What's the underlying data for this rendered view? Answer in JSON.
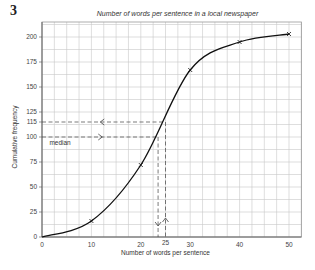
{
  "question_number": "3",
  "chart_data": {
    "type": "line",
    "title": "Number of words per sentence in a local newspaper",
    "xlabel": "Number of words per sentence",
    "ylabel": "Cumulative frequency",
    "xlim": [
      0,
      52.5
    ],
    "ylim": [
      0,
      215
    ],
    "x_ticks": [
      0,
      10,
      20,
      25,
      30,
      40,
      50
    ],
    "y_ticks": [
      0,
      25,
      50,
      75,
      100,
      115,
      125,
      150,
      175,
      200
    ],
    "grid": true,
    "series": [
      {
        "name": "Cumulative frequency curve",
        "x": [
          0,
          10,
          20,
          30,
          40,
          50
        ],
        "y": [
          0,
          16,
          72,
          167,
          195,
          203
        ],
        "markers": "cross"
      }
    ],
    "annotations": [
      {
        "type": "dashed-line",
        "label": "median",
        "y": 100,
        "x_intersect": 23.5
      },
      {
        "type": "dashed-line",
        "y": 115,
        "x_intersect": 25
      }
    ]
  }
}
